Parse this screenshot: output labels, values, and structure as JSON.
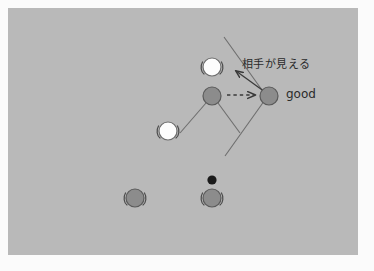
{
  "figure": {
    "kind": "tactical-play-diagram",
    "background_color": "#fbfbfb",
    "field_color": "#b9b9b9",
    "field_border_color": "#a9a9a9",
    "line_color": "#6e6e6e",
    "arrow_color": "#3a3a3a",
    "dark_player_color": "#8c8c8c",
    "dark_player_border": "#5a5a5a",
    "light_player_color": "#fdfdfd",
    "light_player_border": "#6e6e6e",
    "ball_color": "#1a1a1a"
  },
  "annotations": {
    "sight_label": "相手が見える",
    "good_label": "good"
  },
  "players": [
    {
      "id": "light-top",
      "team": "light",
      "x": 212,
      "y": 67,
      "r": 9,
      "arms": true
    },
    {
      "id": "dark-center",
      "team": "dark",
      "x": 212,
      "y": 96,
      "r": 9,
      "legs": true
    },
    {
      "id": "light-left",
      "team": "light",
      "x": 168,
      "y": 131,
      "r": 9,
      "arms": true
    },
    {
      "id": "dark-good",
      "team": "dark",
      "x": 269,
      "y": 96,
      "r": 9,
      "legs": false
    },
    {
      "id": "dark-bottom-left",
      "team": "dark",
      "x": 135,
      "y": 198,
      "r": 9,
      "arms": true
    },
    {
      "id": "dark-bottom-right",
      "team": "dark",
      "x": 212,
      "y": 198,
      "r": 9,
      "arms": true
    }
  ],
  "ball": {
    "id": "ball",
    "x": 212,
    "y": 180,
    "r": 4.5
  },
  "sight_lines": [
    {
      "id": "sight-line-upper",
      "x1": 224,
      "y1": 37,
      "x2": 272,
      "y2": 104
    },
    {
      "id": "sight-line-lower",
      "x1": 225,
      "y1": 156,
      "x2": 272,
      "y2": 90
    }
  ],
  "body_lines": [
    {
      "id": "leg-left",
      "x1": 205,
      "y1": 104,
      "x2": 182,
      "y2": 131
    },
    {
      "id": "leg-right",
      "x1": 219,
      "y1": 104,
      "x2": 238,
      "y2": 131
    }
  ],
  "arrows": [
    {
      "id": "sight-arrow",
      "style": "solid",
      "from_x": 265,
      "from_y": 92,
      "to_x": 233,
      "to_y": 70,
      "meaning": "相手が見える"
    },
    {
      "id": "pass-arrow",
      "style": "dashed",
      "from_x": 227,
      "from_y": 95,
      "to_x": 257,
      "to_y": 95,
      "meaning": "pass / move"
    }
  ]
}
